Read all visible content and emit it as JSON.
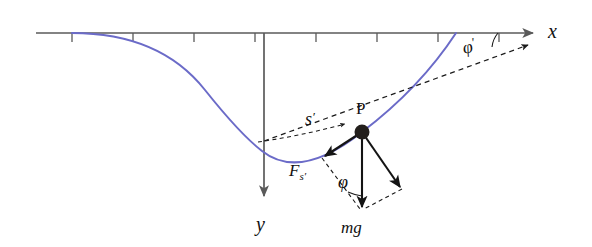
{
  "figure": {
    "background_color": "#ffffff",
    "width": 592,
    "height": 247
  },
  "colors": {
    "curve": "#6b6bc8",
    "axis": "#5a5a5a",
    "vector": "#141414",
    "dashed": "#1a1a1a",
    "point": "#231f1c",
    "text": "#111111"
  },
  "axes": {
    "x_axis": {
      "label": "x",
      "label_x": 548,
      "label_y": 37,
      "start_x": 36,
      "end_x": 533,
      "y": 33,
      "arrow": "right",
      "tick_count": 9,
      "tick_spacing": 61,
      "tick_first_x": 72,
      "tick_length": 9
    },
    "y_axis": {
      "label": "y",
      "label_x": 257,
      "label_y": 225,
      "x": 264,
      "start_y": 33,
      "end_y": 196,
      "arrow": "down"
    }
  },
  "curve": {
    "name": "trajectory-parabola",
    "vertex_x": 262,
    "vertex_y": 151,
    "left_end_x": 72,
    "left_end_y": 33,
    "right_end_x": 456,
    "right_end_y": 33
  },
  "point": {
    "label": "P",
    "label_x": 362,
    "label_y": 112,
    "x": 362,
    "y": 132,
    "radius": 7.5
  },
  "labels": {
    "arc_length": "s",
    "arc_length_prime": "′",
    "arc_length_x": 313,
    "arc_length_y": 119,
    "tangent_force": "F",
    "tangent_force_sub": "s′",
    "tangent_force_x": 296,
    "tangent_force_y": 170,
    "weight": "mg",
    "weight_x": 345,
    "weight_y": 226,
    "angle_phi": "φ",
    "angle_phi_x": 347,
    "angle_phi_y": 182,
    "angle_phi_prime": "φ",
    "angle_phi_prime_mark": "′",
    "angle_phi_prime_x": 471,
    "angle_phi_prime_y": 49
  },
  "vectors": {
    "tangential": {
      "name": "F_s-prime",
      "from_x": 362,
      "from_y": 132,
      "to_x": 325,
      "to_y": 156
    },
    "weight": {
      "name": "mg",
      "from_x": 362,
      "from_y": 132,
      "to_x": 362,
      "to_y": 207
    },
    "normal": {
      "name": "normal-component",
      "from_x": 362,
      "from_y": 132,
      "to_x": 400,
      "to_y": 187
    }
  },
  "dashed_elements": {
    "tangent_line": {
      "name": "tangent-dashed-line",
      "from_x": 264,
      "from_y": 141,
      "to_x": 528,
      "to_y": 45
    },
    "parallelogram_side_a": {
      "from_x": 325,
      "from_y": 156,
      "to_x": 362,
      "to_y": 207
    },
    "parallelogram_side_b": {
      "from_x": 400,
      "from_y": 187,
      "to_x": 362,
      "to_y": 207
    }
  }
}
